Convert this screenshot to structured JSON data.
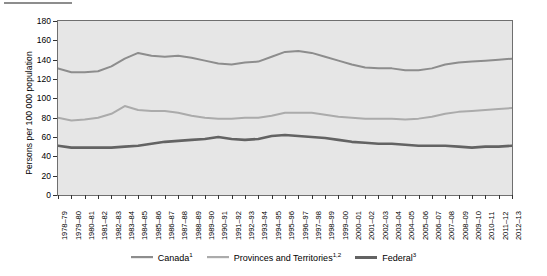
{
  "figure": {
    "background_color": "#ffffff",
    "plot_background_color": "#e6e6e6",
    "plot_border_color": "#6f6f6f"
  },
  "axes": {
    "ylabel": "Persons per 100 000 population",
    "yticks": [
      0,
      20,
      40,
      60,
      80,
      100,
      120,
      140,
      160,
      180
    ],
    "ylim": [
      0,
      180
    ]
  },
  "legend": {
    "position": "below",
    "items": [
      {
        "label": "Canada",
        "sup": "1",
        "color": "#8d8d8d",
        "width": 2.2
      },
      {
        "label": "Provinces and Territories",
        "sup": "1,2",
        "color": "#ababab",
        "width": 2.2
      },
      {
        "label": "Federal",
        "sup": "3",
        "color": "#636363",
        "width": 3.0
      }
    ]
  },
  "chart_data": {
    "type": "line",
    "title": "",
    "xlabel": "",
    "ylabel": "Persons per 100 000 population",
    "ylim": [
      0,
      180
    ],
    "yticks": [
      0,
      20,
      40,
      60,
      80,
      100,
      120,
      140,
      160,
      180
    ],
    "grid": false,
    "legend_position": "bottom",
    "categories": [
      "1978–79",
      "1979–80",
      "1980–81",
      "1981–82",
      "1982–83",
      "1983–84",
      "1984–85",
      "1985–86",
      "1986–87",
      "1987–88",
      "1988–89",
      "1989–90",
      "1990–91",
      "1991–92",
      "1992–93",
      "1993–94",
      "1994–95",
      "1995–96",
      "1996–97",
      "1997–98",
      "1998–99",
      "1999–00",
      "2000–01",
      "2001–02",
      "2002–03",
      "2003–04",
      "2004–05",
      "2005–06",
      "2006–07",
      "2007–08",
      "2008–09",
      "2009–10",
      "2010–11",
      "2011–12",
      "2012–13"
    ],
    "series": [
      {
        "name": "Canada",
        "color": "#8d8d8d",
        "values": [
          131,
          127,
          127,
          128,
          133,
          141,
          147,
          144,
          143,
          144,
          142,
          139,
          136,
          135,
          137,
          138,
          143,
          148,
          149,
          147,
          143,
          139,
          135,
          132,
          131,
          131,
          129,
          129,
          131,
          135,
          137,
          138,
          139,
          140,
          141
        ]
      },
      {
        "name": "Provinces and Territories",
        "color": "#ababab",
        "values": [
          80,
          77,
          78,
          80,
          84,
          92,
          88,
          87,
          87,
          85,
          82,
          80,
          79,
          79,
          80,
          80,
          82,
          85,
          85,
          85,
          83,
          81,
          80,
          79,
          79,
          79,
          78,
          79,
          81,
          84,
          86,
          87,
          88,
          89,
          90
        ]
      },
      {
        "name": "Federal",
        "color": "#636363",
        "values": [
          51,
          49,
          49,
          49,
          49,
          50,
          51,
          53,
          55,
          56,
          57,
          58,
          60,
          58,
          57,
          58,
          61,
          62,
          61,
          60,
          59,
          57,
          55,
          54,
          53,
          53,
          52,
          51,
          51,
          51,
          50,
          49,
          50,
          50,
          51
        ]
      }
    ]
  }
}
